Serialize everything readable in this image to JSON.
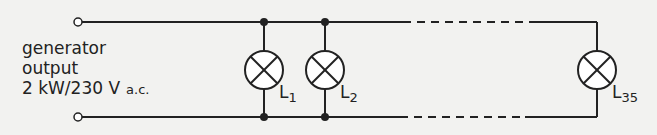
{
  "diagram": {
    "generator": {
      "line1": "generator",
      "line2": "output",
      "line3": "2 kW/230 V",
      "ac": "a.c."
    },
    "lamps": [
      {
        "name": "L",
        "sub": "1"
      },
      {
        "name": "L",
        "sub": "2"
      },
      {
        "name": "L",
        "sub": "35"
      }
    ],
    "colors": {
      "wire": "#222222",
      "background": "#f2f2f0"
    }
  }
}
